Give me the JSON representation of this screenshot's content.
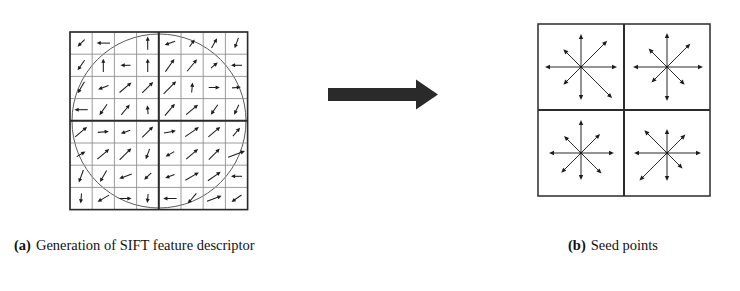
{
  "figure": {
    "background_color": "#ffffff",
    "ink_color": "#1d1d1d",
    "grid_line_color": "#8a8a8a",
    "grid_major_color": "#2b2b2b",
    "circle_color": "#5a5a5a",
    "arrow_color": "#2a2a2a",
    "panels": [
      "panel-a",
      "arrow",
      "panel-b"
    ]
  },
  "captions": {
    "a": {
      "tag": "(a)",
      "text": "Generation of SIFT feature descriptor"
    },
    "b": {
      "tag": "(b)",
      "text": "Seed points"
    }
  },
  "panel_a": {
    "name": "sift-descriptor-window",
    "grid": {
      "cols": 8,
      "rows": 8,
      "x": 52,
      "y": 24,
      "cell": 22.2,
      "quadrant_divider_after": 4
    },
    "circle": {
      "cx": 141,
      "cy": 113,
      "r": 87
    },
    "gradient_arrows_deg": [
      [
        225,
        180,
        null,
        90,
        200,
        55,
        60,
        250
      ],
      [
        235,
        90,
        180,
        90,
        55,
        50,
        40,
        180
      ],
      [
        240,
        200,
        40,
        45,
        45,
        85,
        0,
        5
      ],
      [
        180,
        235,
        50,
        95,
        50,
        40,
        235,
        245
      ],
      [
        40,
        5,
        200,
        45,
        10,
        35,
        40,
        50
      ],
      [
        30,
        40,
        45,
        250,
        210,
        40,
        45,
        20
      ],
      [
        250,
        240,
        200,
        225,
        200,
        30,
        35,
        180
      ],
      [
        265,
        210,
        0,
        265,
        180,
        230,
        20,
        215
      ]
    ],
    "arrow_lengths": [
      [
        0.45,
        0.6,
        0,
        0.6,
        0.5,
        0.4,
        0.5,
        0.5
      ],
      [
        0.55,
        0.6,
        0.45,
        0.6,
        0.7,
        0.7,
        0.4,
        0.5
      ],
      [
        0.6,
        0.5,
        0.7,
        0.7,
        0.8,
        0.45,
        0.5,
        0.4
      ],
      [
        0.6,
        0.6,
        0.6,
        0.4,
        0.7,
        0.7,
        0.55,
        0.5
      ],
      [
        0.7,
        0.5,
        0.45,
        0.7,
        0.55,
        0.75,
        0.7,
        0.5
      ],
      [
        0.45,
        0.7,
        0.75,
        0.5,
        0.45,
        0.7,
        0.7,
        0.8
      ],
      [
        0.6,
        0.6,
        0.6,
        0.45,
        0.45,
        0.7,
        0.7,
        0.5
      ],
      [
        0.45,
        0.6,
        0.55,
        0.4,
        0.6,
        0.6,
        0.7,
        0.55
      ]
    ],
    "description": "8x8 sampled image gradient grid inside a Gaussian weighting circle, divided into 4 quadrants"
  },
  "panel_b": {
    "name": "seed-points-descriptor",
    "grid": {
      "cols": 2,
      "rows": 2,
      "x": 18,
      "y": 16,
      "cell": 86
    },
    "seed_count": 4,
    "orientations_per_seed": 8,
    "seeds": [
      {
        "name": "seed-top-left",
        "cx": 61,
        "cy": 59,
        "spokes": [
          {
            "deg": 90,
            "len": 33
          },
          {
            "deg": 45,
            "len": 37
          },
          {
            "deg": 0,
            "len": 36
          },
          {
            "deg": 315,
            "len": 44
          },
          {
            "deg": 270,
            "len": 33
          },
          {
            "deg": 225,
            "len": 25
          },
          {
            "deg": 180,
            "len": 36
          },
          {
            "deg": 135,
            "len": 25
          }
        ]
      },
      {
        "name": "seed-top-right",
        "cx": 147,
        "cy": 59,
        "spokes": [
          {
            "deg": 90,
            "len": 34
          },
          {
            "deg": 45,
            "len": 33
          },
          {
            "deg": 0,
            "len": 36
          },
          {
            "deg": 315,
            "len": 25
          },
          {
            "deg": 270,
            "len": 34
          },
          {
            "deg": 225,
            "len": 22
          },
          {
            "deg": 180,
            "len": 34
          },
          {
            "deg": 135,
            "len": 26
          }
        ]
      },
      {
        "name": "seed-bottom-left",
        "cx": 61,
        "cy": 145,
        "spokes": [
          {
            "deg": 90,
            "len": 33
          },
          {
            "deg": 45,
            "len": 27
          },
          {
            "deg": 0,
            "len": 33
          },
          {
            "deg": 315,
            "len": 29
          },
          {
            "deg": 270,
            "len": 27
          },
          {
            "deg": 225,
            "len": 28
          },
          {
            "deg": 180,
            "len": 32
          },
          {
            "deg": 135,
            "len": 24
          }
        ]
      },
      {
        "name": "seed-bottom-right",
        "cx": 147,
        "cy": 145,
        "spokes": [
          {
            "deg": 90,
            "len": 24
          },
          {
            "deg": 45,
            "len": 26
          },
          {
            "deg": 0,
            "len": 34
          },
          {
            "deg": 315,
            "len": 22
          },
          {
            "deg": 270,
            "len": 28
          },
          {
            "deg": 225,
            "len": 39
          },
          {
            "deg": 180,
            "len": 33
          },
          {
            "deg": 135,
            "len": 32
          }
        ]
      }
    ],
    "description": "2x2 array of seed points each holding 8 orientation bins"
  },
  "arrow": {
    "name": "transform-arrow",
    "direction": "right",
    "shaft": {
      "x": 0,
      "y": 10,
      "w": 88,
      "h": 13
    },
    "head": {
      "w": 22,
      "h": 30
    }
  }
}
